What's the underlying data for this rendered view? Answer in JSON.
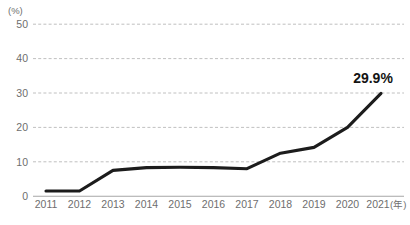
{
  "chart_data": {
    "type": "line",
    "title": "",
    "subtitle": "",
    "xlabel": "(年)",
    "ylabel": "(%)",
    "categories": [
      "2011",
      "2012",
      "2013",
      "2014",
      "2015",
      "2016",
      "2017",
      "2018",
      "2019",
      "2020",
      "2021"
    ],
    "series": [
      {
        "name": "割合",
        "values": [
          1.5,
          1.5,
          7.5,
          8.3,
          8.4,
          8.3,
          8.0,
          12.5,
          14.2,
          20.0,
          29.9
        ],
        "color": "#1c1c1c"
      }
    ],
    "ylim": [
      0,
      50
    ],
    "yticks": [
      0,
      10,
      20,
      30,
      40,
      50
    ],
    "ytick_labels": [
      "0",
      "10",
      "20",
      "30",
      "40",
      "50"
    ],
    "grid": true,
    "grid_axis": "y",
    "grid_style": "dashed",
    "grid_color": "#b9b9b9",
    "baseline_color": "#a6a6a6",
    "legend": false,
    "legend_position": "none",
    "background_color": "#ffffff",
    "annotations": [
      {
        "text": "29.9%",
        "x_category": "2021",
        "value": 29.9,
        "bold": true,
        "color": "#141414"
      }
    ]
  },
  "axis": {
    "y_unit_label": "(%)",
    "x_unit_label": "(年)"
  },
  "footnote": {
    "text": ""
  }
}
